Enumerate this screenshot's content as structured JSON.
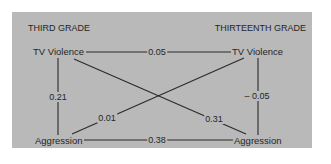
{
  "diagram": {
    "type": "cross-lagged-panel-correlation",
    "left_header": "THIRD GRADE",
    "right_header": "THIRTEENTH GRADE",
    "nodes": {
      "tv_violence_3": "TV Violence",
      "aggression_3": "Aggression",
      "tv_violence_13": "TV Violence",
      "aggression_13": "Aggression"
    },
    "edges": [
      {
        "from": "tv_violence_3",
        "to": "tv_violence_13",
        "label": "0.05"
      },
      {
        "from": "tv_violence_3",
        "to": "aggression_3",
        "label": "0.21"
      },
      {
        "from": "aggression_3",
        "to": "tv_violence_13",
        "label": "0.01"
      },
      {
        "from": "tv_violence_3",
        "to": "aggression_13",
        "label": "0.31"
      },
      {
        "from": "tv_violence_13",
        "to": "aggression_13",
        "label": "– 0.05"
      },
      {
        "from": "aggression_3",
        "to": "aggression_13",
        "label": "0.38"
      }
    ],
    "colors": {
      "panel": "#b9b9b9",
      "line": "#2a2a2a",
      "text": "#262626"
    }
  }
}
